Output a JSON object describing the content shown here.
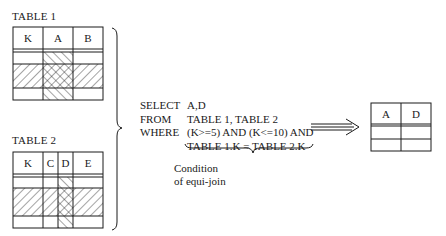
{
  "table1": {
    "title": "TABLE 1",
    "columns": [
      "K",
      "A",
      "B"
    ]
  },
  "table2": {
    "title": "TABLE 2",
    "columns": [
      "K",
      "C",
      "D",
      "E"
    ]
  },
  "query": {
    "select_kw": "SELECT",
    "select_val": "A,D",
    "from_kw": "FROM",
    "from_val": "TABLE 1, TABLE 2",
    "where_kw": "WHERE",
    "where_val": "(K>=5) AND (K<=10) AND",
    "where_cont": "TABLE 1.K = TABLE 2.K"
  },
  "caption": {
    "line1": "Condition",
    "line2": "of equi-join"
  },
  "result": {
    "columns": [
      "A",
      "D"
    ]
  },
  "colors": {
    "line": "#1a1a1a",
    "background": "#ffffff"
  }
}
